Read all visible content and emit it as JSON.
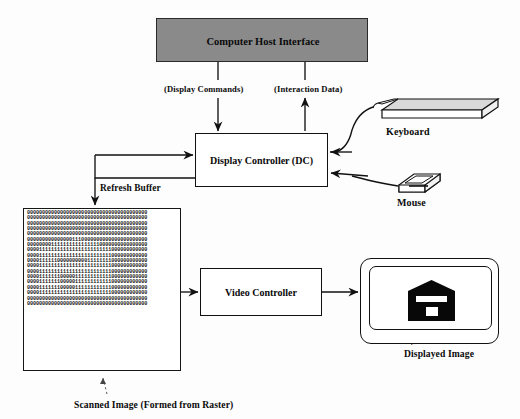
{
  "diagram": {
    "host": {
      "label": "Computer Host Interface",
      "fill_color": "#8a8a8a",
      "stroke_color": "#2a2a2a"
    },
    "nodes": [
      {
        "id": "display-controller",
        "label": "Display Controller (DC)"
      },
      {
        "id": "video-controller",
        "label": "Video Controller"
      }
    ],
    "channels": [
      {
        "id": "display-commands",
        "label": "(Display Commands)",
        "direction": "down"
      },
      {
        "id": "interaction-data",
        "label": "(Interaction Data)",
        "direction": "up"
      }
    ],
    "edge_labels": {
      "refresh_buffer": "Refresh Buffer"
    },
    "devices": [
      {
        "id": "keyboard",
        "label": "Keyboard"
      },
      {
        "id": "mouse",
        "label": "Mouse"
      }
    ],
    "captions": {
      "displayed_image": "Displayed Image",
      "scanned_image": "Scanned Image (Formed from Raster)"
    },
    "raster": {
      "description": "Bitmap of binary digits forming a house/barn silhouette",
      "zero_char": "0",
      "one_char": "1",
      "rows": 18,
      "columns": 40,
      "bitmap": [
        "0000000000000000000000000000000000000000",
        "0000000000000000000000000000000000000000",
        "0000000000000000000000000000000000000000",
        "0000000000000000000000000000000000000000",
        "0000000000000000000000000000000000000000",
        "0000000000000001110000000000000000000000",
        "0000000011111111111111110000000000000000",
        "0000111111111111111111111111000000000000",
        "0000111111111111111111111111000000000000",
        "0000111111000000000011111111000000000000",
        "0000111111111111111111111111000000000000",
        "0000111111111111111111111111000000000000",
        "0000111111100000111111111111000000000000",
        "0000111111100000111111111111000000000000",
        "0000111111100000111111111111000000000000",
        "0000111111111111111111111111000000000000",
        "0000000000000000000000000000000000000000",
        "0000000000000000000000000000000000000000"
      ]
    },
    "colors": {
      "line": "#111111",
      "text": "#0a0a0a",
      "glyph_fill": "#080808",
      "background": "#fdfdfd"
    }
  }
}
